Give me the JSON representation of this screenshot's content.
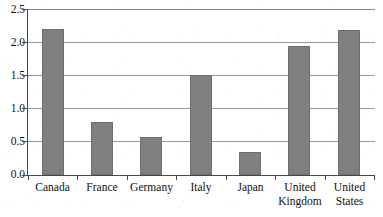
{
  "chart_data": {
    "type": "bar",
    "title": "",
    "subtitle": "",
    "xlabel": "",
    "ylabel": "",
    "categories": [
      "Canada",
      "France",
      "Germany",
      "Italy",
      "Japan",
      "United Kingdom",
      "United States"
    ],
    "values": [
      2.2,
      0.8,
      0.58,
      1.5,
      0.35,
      1.94,
      2.18
    ],
    "series": [
      {
        "name": "",
        "values": [
          2.2,
          0.8,
          0.58,
          1.5,
          0.35,
          1.94,
          2.18
        ]
      }
    ],
    "ylim": [
      0.0,
      2.5
    ],
    "ytick_values": [
      0.0,
      0.5,
      1.0,
      1.5,
      2.0,
      2.5
    ],
    "ytick_labels": [
      "0.0",
      "0.5",
      "1.0",
      "1.5",
      "2.0",
      "2.5"
    ],
    "grid": "horizontal",
    "legend": "none",
    "bar_color": "#808080",
    "bar_edge_color": "#6e6e6e",
    "gridline_color": "#9a9a9a",
    "axis_color": "#4a4a4a",
    "background_color": "#ffffff"
  },
  "axes": {
    "y": {
      "ticks": [
        {
          "label": "2.5",
          "value": 2.5
        },
        {
          "label": "2.0",
          "value": 2.0
        },
        {
          "label": "1.5",
          "value": 1.5
        },
        {
          "label": "1.0",
          "value": 1.0
        },
        {
          "label": "0.5",
          "value": 0.5
        },
        {
          "label": "0.0",
          "value": 0.0
        }
      ]
    },
    "x": {
      "ticks": [
        {
          "label": "Canada"
        },
        {
          "label": "France"
        },
        {
          "label": "Germany"
        },
        {
          "label": "Italy"
        },
        {
          "label": "Japan"
        },
        {
          "label": "United\nKingdom"
        },
        {
          "label": "United\nStates"
        }
      ]
    }
  }
}
